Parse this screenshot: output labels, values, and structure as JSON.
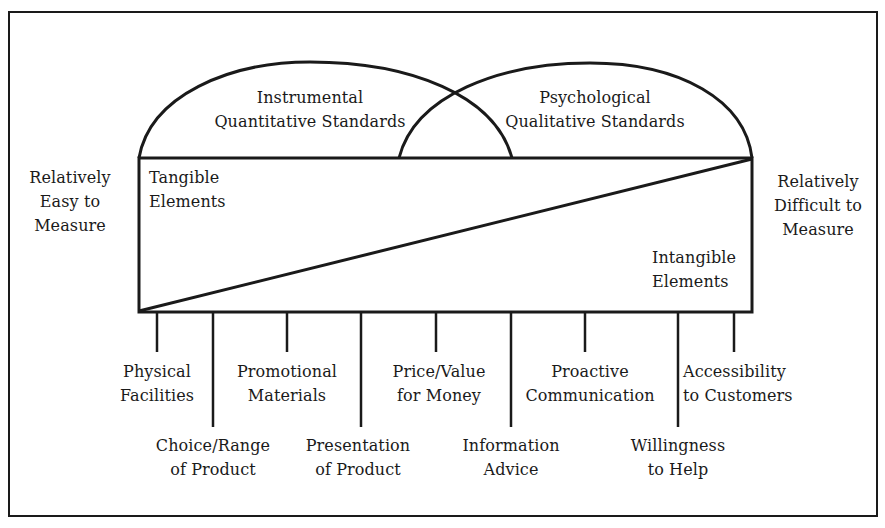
{
  "diagram": {
    "line_color": "#1a1a1a",
    "background": "#ffffff",
    "standards": {
      "instrumental": {
        "line1": "Instrumental",
        "line2": "Quantitative Standards"
      },
      "psychological": {
        "line1": "Psychological",
        "line2": "Qualitative Standards"
      }
    },
    "scale": {
      "left": {
        "line1": "Relatively",
        "line2": "Easy to",
        "line3": "Measure"
      },
      "right": {
        "line1": "Relatively",
        "line2": "Difficult to",
        "line3": "Measure"
      }
    },
    "elements": {
      "tangible": {
        "line1": "Tangible",
        "line2": "Elements"
      },
      "intangible": {
        "line1": "Intangible",
        "line2": "Elements"
      }
    },
    "factors": [
      {
        "line1": "Physical",
        "line2": "Facilities",
        "row": "upper"
      },
      {
        "line1": "Choice/Range",
        "line2": "of Product",
        "row": "lower"
      },
      {
        "line1": "Promotional",
        "line2": "Materials",
        "row": "upper"
      },
      {
        "line1": "Presentation",
        "line2": "of Product",
        "row": "lower"
      },
      {
        "line1": "Price/Value",
        "line2": "for Money",
        "row": "upper"
      },
      {
        "line1": "Information",
        "line2": "Advice",
        "row": "lower"
      },
      {
        "line1": "Proactive",
        "line2": "Communication",
        "row": "upper"
      },
      {
        "line1": "Willingness",
        "line2": "to Help",
        "row": "lower"
      },
      {
        "line1": "Accessibility",
        "line2": "to Customers",
        "row": "upper"
      }
    ]
  }
}
